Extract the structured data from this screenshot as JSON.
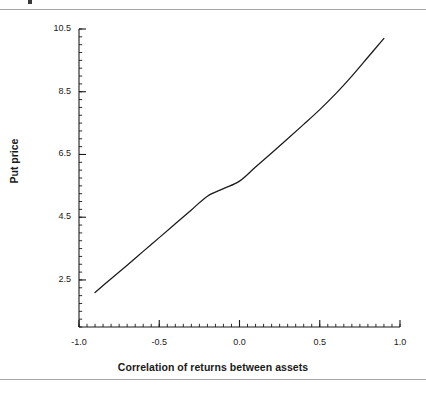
{
  "figure": {
    "background_color": "#ffffff",
    "rule_color": "#a6a6a6",
    "line_color": "#1a1a1a",
    "axis_color": "#1a1a1a"
  },
  "chart_data": {
    "type": "line",
    "title": "",
    "xlabel": "Correlation of returns between assets",
    "ylabel": "Put price",
    "xlim": [
      -1.0,
      1.0
    ],
    "ylim": [
      1.0,
      10.5
    ],
    "grid": false,
    "legend": false,
    "xticks": [
      -1.0,
      -0.5,
      0.0,
      0.5,
      1.0
    ],
    "xtick_labels": [
      "-1.0",
      "-0.5",
      "0.0",
      "0.5",
      "1.0"
    ],
    "yticks": [
      2.5,
      4.5,
      6.5,
      8.5,
      10.5
    ],
    "ytick_labels": [
      "2.5",
      "4.5",
      "6.5",
      "8.5",
      "10.5"
    ],
    "x_minor_tick_interval": 0.05,
    "y_minor_tick_interval": 0.25,
    "series": [
      {
        "name": "Put price vs correlation",
        "x": [
          -0.9,
          -0.8,
          -0.7,
          -0.6,
          -0.5,
          -0.4,
          -0.3,
          -0.2,
          -0.1,
          0.0,
          0.1,
          0.2,
          0.3,
          0.4,
          0.5,
          0.6,
          0.7,
          0.8,
          0.9
        ],
        "y": [
          2.1,
          2.54,
          2.97,
          3.41,
          3.85,
          4.29,
          4.73,
          5.17,
          5.41,
          5.65,
          6.1,
          6.55,
          7.0,
          7.46,
          7.93,
          8.44,
          9.0,
          9.6,
          10.2
        ]
      }
    ]
  },
  "axis_geometry": {
    "left_px": 79,
    "right_px": 400,
    "top_px": 29,
    "bottom_px": 327
  }
}
